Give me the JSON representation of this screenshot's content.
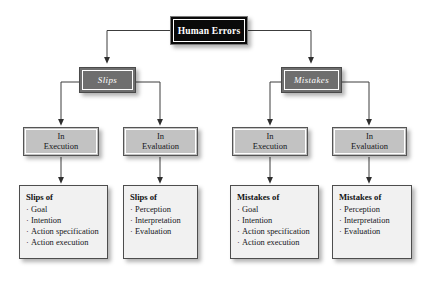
{
  "diagram": {
    "background_color": "#ffffff",
    "colors": {
      "root_fill": "#0a0a0a",
      "root_text": "#ffffff",
      "level2_fill": "#6e6e6e",
      "level2_text": "#ffffff",
      "level3_fill": "#c2c2c2",
      "level3_text": "#16161a",
      "leaf_fill": "#f1f1f1",
      "leaf_text": "#15151a",
      "connector": "#3c3c3c"
    },
    "root": {
      "label": "Human Errors"
    },
    "level2": [
      {
        "label": "Slips"
      },
      {
        "label": "Mistakes"
      }
    ],
    "level3": [
      {
        "line1": "In",
        "line2": "Execution"
      },
      {
        "line1": "In",
        "line2": "Evaluation"
      },
      {
        "line1": "In",
        "line2": "Execution"
      },
      {
        "line1": "In",
        "line2": "Evaluation"
      }
    ],
    "leaves": [
      {
        "title": "Slips of",
        "bullet": "·",
        "items": [
          "Goal",
          "Intention",
          "Action specification",
          "Action execution"
        ]
      },
      {
        "title": "Slips of",
        "bullet": "·",
        "items": [
          "Perception",
          "Interpretation",
          "Evaluation"
        ]
      },
      {
        "title": "Mistakes of",
        "bullet": "·",
        "items": [
          "Goal",
          "Intention",
          "Action specification",
          "Action execution"
        ]
      },
      {
        "title": "Mistakes of",
        "bullet": "·",
        "items": [
          "Perception",
          "Interpretation",
          "Evaluation"
        ]
      }
    ]
  }
}
